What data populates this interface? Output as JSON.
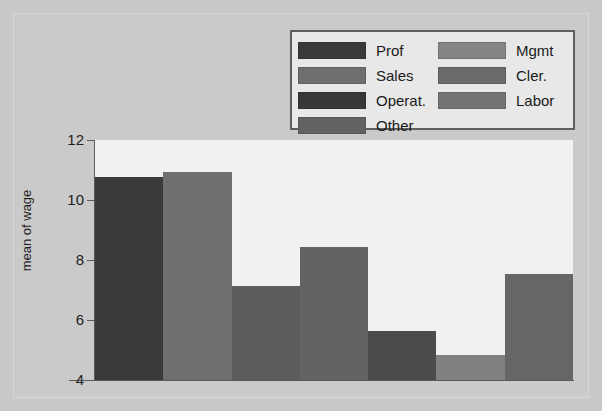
{
  "chart_data": {
    "type": "bar",
    "title": "",
    "xlabel": "",
    "ylabel": "mean of wage",
    "ylim": [
      4,
      12
    ],
    "yticks": [
      4,
      6,
      8,
      10,
      12
    ],
    "ytick_labels": [
      "4",
      "6",
      "8",
      "10",
      "12"
    ],
    "grid": false,
    "legend_position": "top-right",
    "categories": [
      "Prof",
      "Sales",
      "Operat.",
      "Other",
      "Mgmt",
      "Cler.",
      "Labor"
    ],
    "values": [
      10.77,
      10.92,
      7.15,
      8.45,
      5.65,
      4.85,
      7.55
    ],
    "bar_colors": [
      "#3a3a3a",
      "#6f6f6f",
      "#5c5c5c",
      "#636363",
      "#4b4b4b",
      "#818181",
      "#666666"
    ],
    "background_color": "#f1f1f1",
    "canvas_color": "#c9c9c9",
    "axis_color": "#5a5a5a"
  },
  "legend": {
    "columns": [
      {
        "entries": [
          {
            "label": "Prof",
            "color": "#3a3a3a"
          },
          {
            "label": "Sales",
            "color": "#6f6f6f"
          },
          {
            "label": "Operat.",
            "color": "#383838"
          },
          {
            "label": "Other",
            "color": "#636363"
          }
        ]
      },
      {
        "entries": [
          {
            "label": "Mgmt",
            "color": "#858585"
          },
          {
            "label": "Cler.",
            "color": "#6b6b6b"
          },
          {
            "label": "Labor",
            "color": "#737373"
          }
        ]
      }
    ]
  },
  "axis": {
    "y_title": "mean of wage"
  }
}
